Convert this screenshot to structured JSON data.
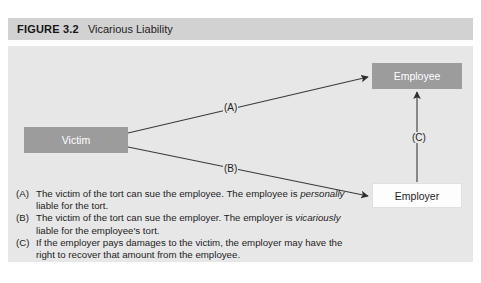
{
  "figure": {
    "number": "FIGURE 3.2",
    "title": "Vicarious Liability"
  },
  "nodes": {
    "victim": "Victim",
    "employee": "Employee",
    "employer": "Employer"
  },
  "edges": {
    "a_label": "(A)",
    "b_label": "(B)",
    "c_label": "(C)"
  },
  "legend": [
    {
      "tag": "(A)",
      "text_before": "The victim of the tort can sue the employee. The employee is ",
      "emphasis": "personally",
      "text_after": " liable for the tort."
    },
    {
      "tag": "(B)",
      "text_before": "The victim of the tort can sue the employer. The employer is ",
      "emphasis": "vicariously",
      "text_after": " liable for the employee's tort."
    },
    {
      "tag": "(C)",
      "text_before": "If the employer pays damages to the victim, the employer may have the right to recover that amount from the employee.",
      "emphasis": "",
      "text_after": ""
    }
  ],
  "colors": {
    "header_bar": "#d2d2d2",
    "body_panel": "#e7e7e7",
    "node_fill_gray": "#9c9c9c",
    "node_fill_white": "#fdfdfd",
    "line": "#3a3a3a"
  }
}
